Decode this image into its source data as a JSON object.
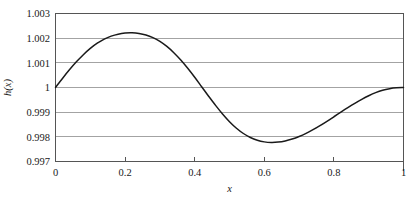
{
  "chart_data": {
    "type": "line",
    "title": "",
    "xlabel": "x",
    "ylabel": "h(x)",
    "xlim": [
      0,
      1
    ],
    "ylim": [
      0.997,
      1.003
    ],
    "grid": true,
    "legend": null,
    "xticks": [
      0,
      0.2,
      0.4,
      0.6,
      0.8,
      1
    ],
    "xtick_labels": [
      "0",
      "0.2",
      "0.4",
      "0.6",
      "0.8",
      "1"
    ],
    "yticks": [
      0.997,
      0.998,
      0.999,
      1,
      1.001,
      1.002,
      1.003
    ],
    "ytick_labels": [
      "0.997",
      "0.998",
      "0.999",
      "1",
      "1.001",
      "1.002",
      "1.003"
    ],
    "series": [
      {
        "name": "h(x)",
        "color": "#1a1a1a",
        "x": [
          0.0,
          0.02,
          0.04,
          0.06,
          0.08,
          0.1,
          0.12,
          0.14,
          0.16,
          0.18,
          0.2,
          0.22,
          0.24,
          0.26,
          0.28,
          0.3,
          0.32,
          0.34,
          0.36,
          0.38,
          0.4,
          0.42,
          0.44,
          0.46,
          0.48,
          0.5,
          0.52,
          0.54,
          0.56,
          0.58,
          0.6,
          0.62,
          0.64,
          0.66,
          0.68,
          0.7,
          0.72,
          0.74,
          0.76,
          0.78,
          0.8,
          0.82,
          0.84,
          0.86,
          0.88,
          0.9,
          0.92,
          0.94,
          0.96,
          0.98,
          1.0
        ],
        "y": [
          1.0,
          1.000368,
          1.000716,
          1.00104,
          1.001331,
          1.001584,
          1.001795,
          1.001962,
          1.002083,
          1.002163,
          1.002206,
          1.002215,
          1.00219,
          1.002128,
          1.002022,
          1.001869,
          1.001665,
          1.001412,
          1.001114,
          1.000778,
          1.000413,
          1.000031,
          0.999647,
          0.999274,
          0.998926,
          0.998615,
          0.99835,
          0.998135,
          0.997973,
          0.997861,
          0.997796,
          0.997773,
          0.997787,
          0.997834,
          0.997911,
          0.998014,
          0.998141,
          0.998289,
          0.998454,
          0.998631,
          0.998814,
          0.998999,
          0.99918,
          0.999354,
          0.999517,
          0.999665,
          0.999793,
          0.999891,
          0.999953,
          0.999988,
          1.0
        ],
        "peak": {
          "x": 0.22,
          "y": 1.0022
        },
        "trough": {
          "x": 0.78,
          "y": 0.9978
        },
        "start": {
          "x": 0,
          "y": 1.0
        },
        "end": {
          "x": 1,
          "y": 1.0
        }
      }
    ],
    "colors": {
      "curve": "#1a1a1a",
      "gridline": "#8c8c8c",
      "frame": "#555555",
      "text": "#1a1a1a",
      "background": "#ffffff"
    }
  }
}
